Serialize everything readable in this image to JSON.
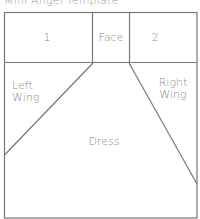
{
  "title": "Mini Angel Template",
  "template": {
    "line_color": "#777777",
    "sections": {
      "box1": "1",
      "face": "Face",
      "box2": "2",
      "left_wing_line1": "Left",
      "left_wing_line2": "Wing",
      "right_wing_line1": "Right",
      "right_wing_line2": "Wing",
      "dress": "Dress"
    }
  }
}
